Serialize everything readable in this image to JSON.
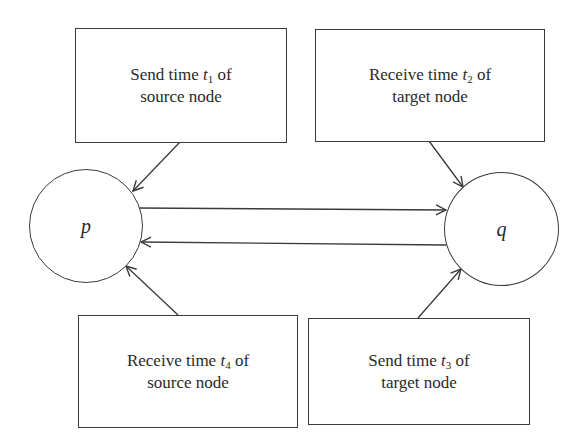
{
  "diagram": {
    "nodes": {
      "p": {
        "label": "p"
      },
      "q": {
        "label": "q"
      }
    },
    "boxes": {
      "send_t1": {
        "line1_pre": "Send time ",
        "var": "t",
        "sub": "1",
        "line1_post": " of",
        "line2": "source node"
      },
      "receive_t2": {
        "line1_pre": "Receive time ",
        "var": "t",
        "sub": "2",
        "line1_post": " of",
        "line2": "target node"
      },
      "receive_t4": {
        "line1_pre": "Receive time ",
        "var": "t",
        "sub": "4",
        "line1_post": " of",
        "line2": "source node"
      },
      "send_t3": {
        "line1_pre": "Send time ",
        "var": "t",
        "sub": "3",
        "line1_post": " of",
        "line2": "target node"
      }
    },
    "edges": [
      {
        "from": "send_t1",
        "to": "p"
      },
      {
        "from": "receive_t2",
        "to": "q"
      },
      {
        "from": "p",
        "to": "q"
      },
      {
        "from": "q",
        "to": "p"
      },
      {
        "from": "receive_t4",
        "to": "p"
      },
      {
        "from": "send_t3",
        "to": "q"
      }
    ],
    "colors": {
      "stroke": "#3a3a3a",
      "text": "#2a2a2a",
      "background": "#ffffff"
    }
  }
}
